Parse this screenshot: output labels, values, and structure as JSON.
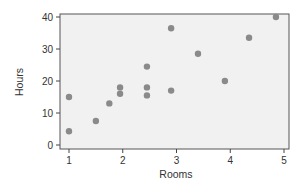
{
  "chart_data": {
    "type": "scatter",
    "title": "",
    "xlabel": "Rooms",
    "ylabel": "Hours",
    "xlim": [
      0.9,
      5.05
    ],
    "ylim": [
      -1.3,
      41
    ],
    "x_ticks": [
      1,
      2,
      3,
      4,
      5
    ],
    "y_ticks": [
      0,
      10,
      20,
      30,
      40
    ],
    "grid": false,
    "legend": null,
    "series": [
      {
        "name": "points",
        "color": "#8a8a8a",
        "points": [
          {
            "x": 1.0,
            "y": 15
          },
          {
            "x": 1.0,
            "y": 4.3
          },
          {
            "x": 1.5,
            "y": 7.5
          },
          {
            "x": 1.75,
            "y": 13
          },
          {
            "x": 1.95,
            "y": 18
          },
          {
            "x": 1.95,
            "y": 16
          },
          {
            "x": 2.45,
            "y": 24.5
          },
          {
            "x": 2.45,
            "y": 18
          },
          {
            "x": 2.45,
            "y": 15.5
          },
          {
            "x": 2.9,
            "y": 17
          },
          {
            "x": 2.9,
            "y": 36.5
          },
          {
            "x": 3.4,
            "y": 28.5
          },
          {
            "x": 3.9,
            "y": 20
          },
          {
            "x": 4.35,
            "y": 33.5
          },
          {
            "x": 4.85,
            "y": 40
          }
        ]
      }
    ]
  },
  "style": {
    "plot_bg": "#f1f1f1",
    "frame_color": "#555555",
    "tick_color": "#444444"
  }
}
